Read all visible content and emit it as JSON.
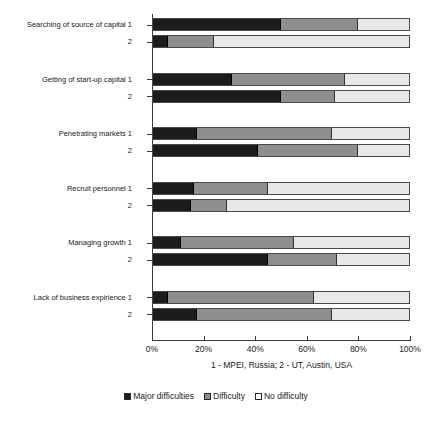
{
  "chart_data": {
    "type": "bar",
    "orientation": "horizontal",
    "stacked": true,
    "normalized": true,
    "title": "",
    "subtitle": "",
    "xlabel": "1 - MPEI, Russia; 2 - UT, Austin, USA",
    "ylabel": "",
    "xlim": [
      0,
      100
    ],
    "grid": false,
    "legend_position": "bottom",
    "xtick_labels": [
      "0%",
      "20%",
      "40%",
      "60%",
      "80%",
      "100%"
    ],
    "xticks": [
      0,
      20,
      40,
      60,
      80,
      100
    ],
    "series": [
      {
        "name": "Major difficulties",
        "color": "#1c1c1c"
      },
      {
        "name": "Difficulty",
        "color": "#8e8e8e"
      },
      {
        "name": "No difficulty",
        "color": "#e8e8e8"
      }
    ],
    "categories": [
      "Searching of source of capital",
      "Getting of start-up capital",
      "Penetrating markets",
      "Recruit personnel",
      "Managing growth",
      "Lack of business expirience"
    ],
    "groups": [
      {
        "category": "Searching of source of capital",
        "rows": [
          {
            "label": "1",
            "values": [
              50,
              30,
              20
            ]
          },
          {
            "label": "2",
            "values": [
              6,
              18,
              76
            ]
          }
        ]
      },
      {
        "category": "Getting of start-up capital",
        "rows": [
          {
            "label": "1",
            "values": [
              31,
              44,
              25
            ]
          },
          {
            "label": "2",
            "values": [
              50,
              21,
              29
            ]
          }
        ]
      },
      {
        "category": "Penetrating markets",
        "rows": [
          {
            "label": "1",
            "values": [
              17,
              53,
              30
            ]
          },
          {
            "label": "2",
            "values": [
              41,
              39,
              20
            ]
          }
        ]
      },
      {
        "category": "Recruit personnel",
        "rows": [
          {
            "label": "1",
            "values": [
              16,
              29,
              55
            ]
          },
          {
            "label": "2",
            "values": [
              15,
              14,
              71
            ]
          }
        ]
      },
      {
        "category": "Managing growth",
        "rows": [
          {
            "label": "1",
            "values": [
              11,
              44,
              45
            ]
          },
          {
            "label": "2",
            "values": [
              45,
              27,
              28
            ]
          }
        ]
      },
      {
        "category": "Lack of business expirience",
        "rows": [
          {
            "label": "1",
            "values": [
              6,
              57,
              37
            ]
          },
          {
            "label": "2",
            "values": [
              17,
              53,
              30
            ]
          }
        ]
      }
    ]
  },
  "legend": {
    "items": [
      {
        "label": "Major difficulties",
        "swatch": "major-difficulties-swatch"
      },
      {
        "label": "Difficulty",
        "swatch": "difficulty-swatch"
      },
      {
        "label": "No difficulty",
        "swatch": "no-difficulty-swatch"
      }
    ]
  },
  "footnote": "1 - MPEI, Russia; 2 - UT, Austin, USA"
}
